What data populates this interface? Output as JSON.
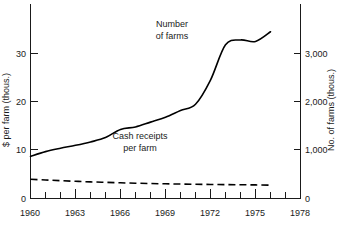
{
  "chart_data": {
    "type": "line",
    "title": "",
    "subtitle": "",
    "xlabel": "",
    "ylabel": "$ per farm (thous.)",
    "y2label": "No. of farms (thous.)",
    "xlim": [
      1960,
      1978
    ],
    "ylim": [
      0,
      40
    ],
    "y2lim": [
      0,
      4000
    ],
    "grid": false,
    "legend_position": "inline-annotation",
    "x_ticks": [
      1960,
      1961,
      1962,
      1963,
      1964,
      1965,
      1966,
      1967,
      1968,
      1969,
      1970,
      1971,
      1972,
      1973,
      1974,
      1975,
      1976,
      1977,
      1978
    ],
    "x_tick_labels": [
      "1960",
      "",
      "",
      "1963",
      "",
      "",
      "1966",
      "",
      "",
      "1969",
      "",
      "",
      "1972",
      "",
      "",
      "1975",
      "",
      "",
      "1978"
    ],
    "y_ticks": [
      0,
      10,
      20,
      30
    ],
    "y_tick_labels": [
      "0",
      "10",
      "20",
      "30"
    ],
    "y2_ticks": [
      0,
      1000,
      2000,
      3000
    ],
    "y2_tick_labels": [
      "0",
      "1,000",
      "2,000",
      "3,000"
    ],
    "series": [
      {
        "name": "Cash receipts per farm",
        "axis": "left",
        "style": "solid",
        "units": "$ thousands per farm",
        "x": [
          1960,
          1961,
          1962,
          1963,
          1964,
          1965,
          1966,
          1967,
          1968,
          1969,
          1970,
          1971,
          1972,
          1973,
          1974,
          1975,
          1976
        ],
        "values": [
          8.7,
          9.7,
          10.4,
          11.0,
          11.7,
          12.6,
          14.3,
          14.8,
          15.8,
          16.8,
          18.2,
          19.5,
          24.5,
          31.8,
          32.8,
          32.5,
          34.5
        ]
      },
      {
        "name": "Number of farms",
        "axis": "right",
        "style": "dashed",
        "units": "thousands of farms",
        "x": [
          1960,
          1961,
          1962,
          1963,
          1964,
          1965,
          1966,
          1967,
          1968,
          1969,
          1970,
          1971,
          1972,
          1973,
          1974,
          1975,
          1976
        ],
        "values": [
          3980,
          3830,
          3690,
          3560,
          3440,
          3340,
          3250,
          3170,
          3100,
          3040,
          2990,
          2950,
          2910,
          2870,
          2840,
          2810,
          2760
        ]
      }
    ],
    "annotations": [
      {
        "id": "number-of-farms-label",
        "line1": "Number",
        "line2": "of farms",
        "x": 1971.0,
        "y_axis": "right",
        "y": 3650
      },
      {
        "id": "cash-receipts-label",
        "line1": "Cash receipts",
        "line2": "per farm",
        "x": 1968.3,
        "y_axis": "left",
        "y": 11.6
      }
    ],
    "colors": {
      "series_line": "#000000",
      "axis": "#1a1a1a",
      "text": "#1a1a1a",
      "background": "#ffffff"
    }
  },
  "axes": {
    "left": {
      "title": "$ per farm (thous.)",
      "labels": [
        "30",
        "20",
        "10",
        "0"
      ]
    },
    "right": {
      "title": "No. of farms (thous.)",
      "labels": [
        "3,000",
        "2,000",
        "1,000",
        "0"
      ]
    },
    "bottom": {
      "labels": [
        "1960",
        "1963",
        "1966",
        "1969",
        "1972",
        "1975",
        "1978"
      ]
    }
  },
  "labels": {
    "left_tick_30": "30",
    "left_tick_20": "20",
    "left_tick_10": "10",
    "left_tick_0": "0",
    "right_tick_3000": "3,000",
    "right_tick_2000": "2,000",
    "right_tick_1000": "1,000",
    "right_tick_0": "0",
    "x_1960": "1960",
    "x_1963": "1963",
    "x_1966": "1966",
    "x_1969": "1969",
    "x_1972": "1972",
    "x_1975": "1975",
    "x_1978": "1978",
    "left_axis_title": "$ per farm (thous.)",
    "right_axis_title": "No. of farms (thous.)",
    "farms_label_line1": "Number",
    "farms_label_line2": "of farms",
    "receipts_label_line1": "Cash receipts",
    "receipts_label_line2": "per farm"
  }
}
